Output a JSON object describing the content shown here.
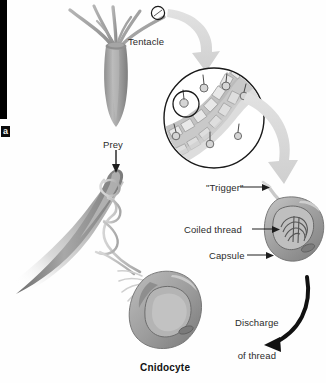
{
  "figure": {
    "caption": "Cnidocyte",
    "part_letter": "a",
    "background_color": "#ffffff",
    "ink_color": "#2b2b2b",
    "organism_gray": "#a9a9a9",
    "arrow_gray": "#d6d6d6",
    "arrow_black": "#111111"
  },
  "labels": {
    "tentacle": "Tentacle",
    "prey": "Prey",
    "trigger": "\"Trigger\"",
    "coiled_thread": "Coiled thread",
    "capsule": "Capsule",
    "discharge_line1": "Discharge",
    "discharge_line2": "of thread",
    "cnidocyte": "Cnidocyte"
  },
  "stages": [
    {
      "name": "polyp-with-tentacles",
      "description": "Hydra-like polyp with radiating tentacles"
    },
    {
      "name": "magnified-tentacle-inset",
      "description": "Circular magnification of tentacle surface showing cnidocytes"
    },
    {
      "name": "undischarged-cnidocyte",
      "description": "Cnidocyte with trigger, coiled thread and capsule intact"
    },
    {
      "name": "discharged-cnidocyte",
      "description": "Cnidocyte after thread discharge, thread wrapped around prey"
    }
  ]
}
